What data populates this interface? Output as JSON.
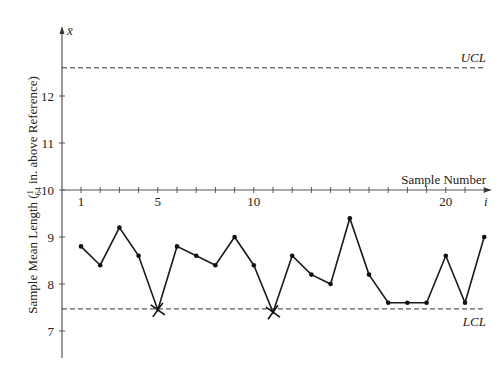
{
  "chart_data": {
    "type": "line",
    "title": "",
    "xlabel": "Sample Number",
    "xaxis_symbol": "i",
    "ylabel": "Sample Mean Length (1/64 in. above Reference)",
    "ylabel_prefix": "Sample Mean Length (",
    "ylabel_fraction_num": "1",
    "ylabel_fraction_den": "64",
    "ylabel_suffix": " in. above Reference)",
    "yaxis_symbol": "x̄",
    "ylim": [
      6.5,
      13.5
    ],
    "xlim": [
      0,
      22.5
    ],
    "grid": false,
    "x_ticks": [
      1,
      2,
      3,
      4,
      5,
      6,
      7,
      8,
      9,
      10,
      11,
      12,
      13,
      14,
      15,
      16,
      17,
      18,
      19,
      20,
      21,
      22
    ],
    "x_tick_labels": [
      {
        "x": 1,
        "label": "1"
      },
      {
        "x": 5,
        "label": "5"
      },
      {
        "x": 10,
        "label": "10"
      },
      {
        "x": 20,
        "label": "20"
      }
    ],
    "y_ticks": [
      7,
      8,
      9,
      10,
      11,
      12
    ],
    "y_tick_labels": [
      "7",
      "8",
      "9",
      "10",
      "11",
      "12"
    ],
    "x_axis_at_y": 10,
    "x": [
      1,
      2,
      3,
      4,
      5,
      6,
      7,
      8,
      9,
      10,
      11,
      12,
      13,
      14,
      15,
      16,
      17,
      18,
      19,
      20,
      21,
      22
    ],
    "series": [
      {
        "name": "Sample mean",
        "values": [
          8.8,
          8.4,
          9.2,
          8.6,
          7.45,
          8.8,
          8.6,
          8.4,
          9.0,
          8.4,
          7.4,
          8.6,
          8.2,
          8.0,
          9.4,
          8.2,
          7.6,
          7.6,
          7.6,
          8.6,
          7.6,
          9.0
        ]
      }
    ],
    "out_of_control_points": [
      5,
      11
    ],
    "control_limits": [
      {
        "name": "UCL",
        "label": "UCL",
        "value": 12.6
      },
      {
        "name": "LCL",
        "label": "LCL",
        "value": 7.47
      }
    ],
    "colors": {
      "line": "#1a1a1a",
      "axis": "#555555",
      "limit": "#333333"
    }
  }
}
